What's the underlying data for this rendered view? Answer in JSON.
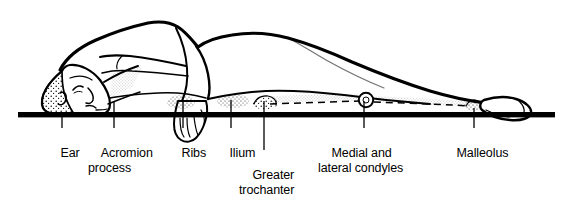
{
  "figure": {
    "style": "black-and-white anatomical line drawing with stippled shading",
    "colors": {
      "line": "#000000",
      "fill": "#ffffff",
      "baseline": "#000000",
      "stipple": "#1a1a1a"
    },
    "baseline": {
      "name": "support-surface-line",
      "description": "horizontal black bar representing the bed or support surface"
    }
  },
  "labels": [
    {
      "id": "ear",
      "line1": "Ear",
      "line2": "",
      "text_x": 47,
      "text_y": 131,
      "leader_x": 62,
      "leader_y1": 114,
      "leader_y2": 128
    },
    {
      "id": "acromion-process",
      "line1": "Acromion",
      "line2": "process",
      "text_x": 88,
      "text_y": 131,
      "leader_x": 114,
      "leader_y1": 101,
      "leader_y2": 128
    },
    {
      "id": "ribs",
      "line1": "Ribs",
      "line2": "",
      "text_x": 168,
      "text_y": 131,
      "leader_x": 183,
      "leader_y1": 100,
      "leader_y2": 128
    },
    {
      "id": "ilium",
      "line1": "Ilium",
      "line2": "",
      "text_x": 216,
      "text_y": 131,
      "leader_x": 231,
      "leader_y1": 100,
      "leader_y2": 128
    },
    {
      "id": "greater-trochanter",
      "line1": "Greater",
      "line2": "trochanter",
      "text_x": 239,
      "text_y": 153,
      "leader_x": 264,
      "leader_y1": 101,
      "leader_y2": 150
    },
    {
      "id": "medial-and-lateral-condyles",
      "line1": "Medial and",
      "line2": "lateral condyles",
      "text_x": 318,
      "text_y": 131,
      "leader_x": 364,
      "leader_y1": 101,
      "leader_y2": 128
    },
    {
      "id": "malleolus",
      "line1": "Malleolus",
      "line2": "",
      "text_x": 443,
      "text_y": 131,
      "leader_x": 474,
      "leader_y1": 108,
      "leader_y2": 128
    }
  ]
}
